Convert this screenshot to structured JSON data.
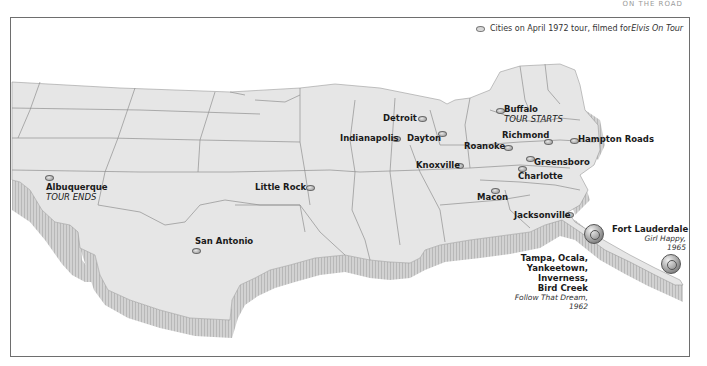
{
  "page_header": "ON THE ROAD",
  "legend": {
    "icon": "city-marker-icon",
    "text": "Cities on April 1972 tour, filmed for ",
    "film_title": "Elvis On Tour"
  },
  "colors": {
    "land": "#e6e6e6",
    "border": "#8a8a8a",
    "extrusion": "#c9c9c9",
    "frame": "#6e6e6e",
    "label": "#1a1a1a"
  },
  "cities": [
    {
      "name": "Buffalo",
      "note": "TOUR STARTS"
    },
    {
      "name": "Detroit"
    },
    {
      "name": "Indianapolis"
    },
    {
      "name": "Dayton"
    },
    {
      "name": "Richmond"
    },
    {
      "name": "Roanoke"
    },
    {
      "name": "Hampton Roads"
    },
    {
      "name": "Knoxville"
    },
    {
      "name": "Greensboro"
    },
    {
      "name": "Charlotte"
    },
    {
      "name": "Macon"
    },
    {
      "name": "Jacksonville"
    },
    {
      "name": "Little Rock"
    },
    {
      "name": "San Antonio"
    },
    {
      "name": "Albuquerque",
      "note": "TOUR ENDS"
    }
  ],
  "film_locations": [
    {
      "name": "Fort Lauderdale",
      "film": "Girl Happy,",
      "year": "1965",
      "icon": "film-reel-icon"
    },
    {
      "name_lines": [
        "Tampa, Ocala,",
        "Yankeetown,",
        "Inverness,",
        "Bird Creek"
      ],
      "film": "Follow That Dream,",
      "year": "1962",
      "icon": "film-reel-icon"
    }
  ]
}
